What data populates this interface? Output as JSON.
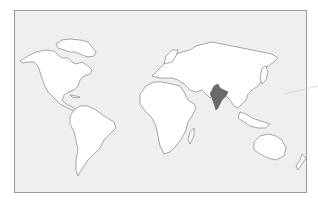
{
  "map": {
    "type": "world-outline",
    "highlighted_region": {
      "name": "India",
      "color": "#6a6a6a"
    },
    "colors": {
      "background": "#efefef",
      "land": "#ffffff",
      "outline": "#6e6e6e",
      "frame": "#9a9a9a"
    },
    "continents": [
      "North America",
      "South America",
      "Europe",
      "Africa",
      "Asia",
      "Australia"
    ]
  }
}
